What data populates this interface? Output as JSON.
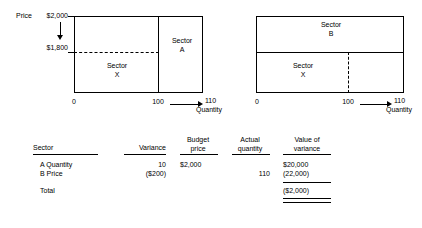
{
  "figure": {
    "left_chart": {
      "price_axis_label": "Price",
      "price_top": "$2,000",
      "price_mid": "$1,800",
      "sector_left_line1": "Sector",
      "sector_left_line2": "X",
      "sector_right_line1": "Sector",
      "sector_right_line2": "A",
      "x_origin": "0",
      "x_mid": "100",
      "x_end": "110",
      "x_axis_label": "Quantity"
    },
    "right_chart": {
      "sector_top_line1": "Sector",
      "sector_top_line2": "B",
      "sector_bottom_line1": "Sector",
      "sector_bottom_line2": "X",
      "x_origin": "0",
      "x_mid": "100",
      "x_end": "110",
      "x_axis_label": "Quantity"
    }
  },
  "table": {
    "headers": {
      "sector": "Sector",
      "variance": "Variance",
      "budget_price_line1": "Budget",
      "budget_price_line2": "price",
      "actual_quantity_line1": "Actual",
      "actual_quantity_line2": "quantity",
      "value_of_variance_line1": "Value of",
      "value_of_variance_line2": "variance"
    },
    "rows": [
      {
        "sector": "A Quantity",
        "variance": "10",
        "budget_price": "$2,000",
        "actual_quantity": "",
        "value_of_variance": "$20,000"
      },
      {
        "sector": "B Price",
        "variance": "($200)",
        "budget_price": "",
        "actual_quantity": "110",
        "value_of_variance": "(22,000)"
      }
    ],
    "total": {
      "label": "Total",
      "value_of_variance": "($2,000)"
    }
  }
}
